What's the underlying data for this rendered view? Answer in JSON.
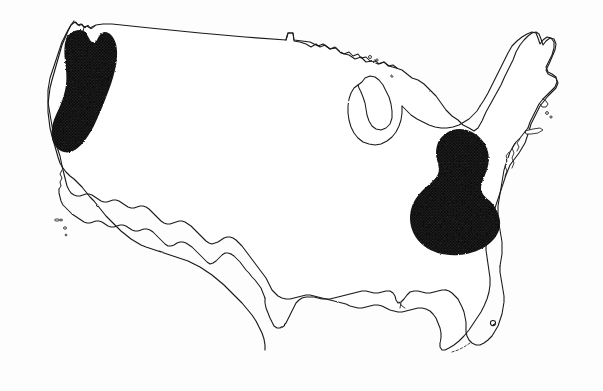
{
  "figure": {
    "kind": "outline-map",
    "title": "",
    "caption": "",
    "background_color": "#fdfdfd",
    "land_fill_color": "#ffffff",
    "outline_color": "#1a1a1a",
    "shaded_region_color": "#151515",
    "shading_style": "dense stipple",
    "labels_present": "none",
    "legend_present": "none",
    "width": 603,
    "height": 391
  },
  "shaded_regions": [
    {
      "name": "pacific-northwest-region",
      "description": "Pacific Northwest coastal range, western Washington through western Oregon into northwestern California",
      "color": "#151515",
      "approx_center": "x 86, y 92",
      "approx_extent": "x 46-118, y 28-152"
    },
    {
      "name": "appalachian-ohio-valley-region",
      "description": "Central Appalachian and Ohio Valley area, West Virginia, Kentucky, Ohio, western Virginia and Tennessee",
      "color": "#151515",
      "approx_center": "x 452, y 182",
      "approx_extent": "x 411-500, y 130-233"
    }
  ],
  "map_features": [
    {
      "name": "national-border-outline",
      "label": "contiguous US coastline and borders"
    },
    {
      "name": "lake-michigan",
      "label": "Lake Michigan"
    },
    {
      "name": "lake-superior-shore",
      "label": "Lake Superior shoreline"
    },
    {
      "name": "florida-peninsula",
      "label": "Florida peninsula"
    },
    {
      "name": "chesapeake-bay",
      "label": "Chesapeake Bay"
    },
    {
      "name": "puget-sound",
      "label": "Puget Sound"
    },
    {
      "name": "channel-islands",
      "label": "Channel Islands"
    },
    {
      "name": "long-island",
      "label": "Long Island"
    },
    {
      "name": "florida-keys",
      "label": "Florida Keys"
    }
  ]
}
